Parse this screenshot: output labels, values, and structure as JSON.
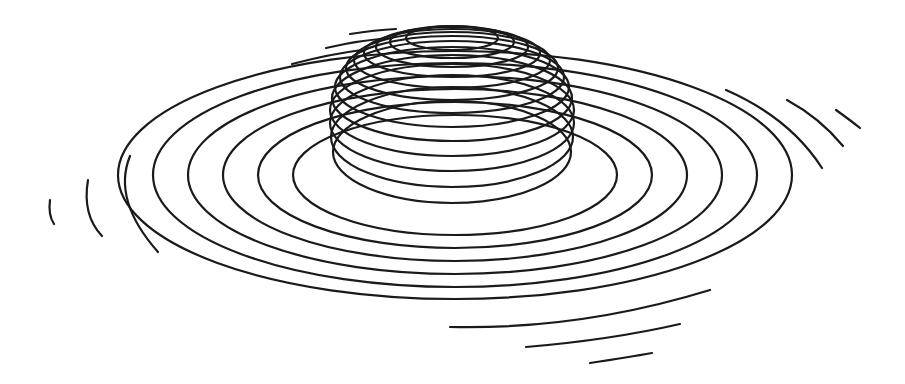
{
  "figure": {
    "width": 905,
    "height": 384,
    "background": "#ffffff",
    "stroke_color": "#1a1a1a",
    "stroke_width": 2.2
  },
  "dome": {
    "center_x": 452,
    "rings": [
      {
        "cy": 38,
        "rx": 46,
        "ry": 12
      },
      {
        "cy": 42,
        "rx": 62,
        "ry": 16
      },
      {
        "cy": 47,
        "rx": 76,
        "ry": 20
      },
      {
        "cy": 53,
        "rx": 88,
        "ry": 24
      },
      {
        "cy": 60,
        "rx": 98,
        "ry": 28
      },
      {
        "cy": 68,
        "rx": 106,
        "ry": 32
      },
      {
        "cy": 77,
        "rx": 112,
        "ry": 36
      },
      {
        "cy": 87,
        "rx": 117,
        "ry": 40
      },
      {
        "cy": 98,
        "rx": 120,
        "ry": 43
      },
      {
        "cy": 110,
        "rx": 122,
        "ry": 46
      },
      {
        "cy": 123,
        "rx": 122,
        "ry": 48
      },
      {
        "cy": 137,
        "rx": 121,
        "ry": 50
      },
      {
        "cy": 152,
        "rx": 119,
        "ry": 51
      }
    ]
  },
  "brim": {
    "center_x": 455,
    "center_y": 175,
    "rings": [
      {
        "rx": 162,
        "ry": 60
      },
      {
        "rx": 197,
        "ry": 73
      },
      {
        "rx": 232,
        "ry": 86
      },
      {
        "rx": 267,
        "ry": 99
      },
      {
        "rx": 302,
        "ry": 112
      },
      {
        "rx": 337,
        "ry": 124
      }
    ]
  },
  "partial_arcs": [
    {
      "d": "M 130 156 Q 112 200 158 252"
    },
    {
      "d": "M 88 180 Q 82 215 102 236"
    },
    {
      "d": "M 50 200 Q 48 215 54 224"
    },
    {
      "d": "M 292 64 Q 330 54 362 50"
    },
    {
      "d": "M 326 48 Q 360 40 392 38"
    },
    {
      "d": "M 350 34 Q 375 30 396 29"
    },
    {
      "d": "M 726 90 Q 790 118 822 168"
    },
    {
      "d": "M 787 100 Q 820 118 843 146"
    },
    {
      "d": "M 836 110 Q 850 120 860 128"
    },
    {
      "d": "M 450 327 Q 580 330 710 290"
    },
    {
      "d": "M 526 347 Q 610 340 680 324"
    },
    {
      "d": "M 590 363 Q 630 357 652 353"
    }
  ]
}
